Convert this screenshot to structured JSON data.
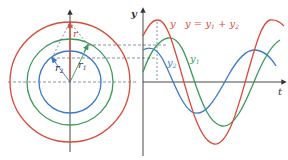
{
  "diagram": {
    "phasor": {
      "labels": {
        "r": "r",
        "r1": "r",
        "r1_sub": "1",
        "r2": "r",
        "r2_sub": "2"
      },
      "circles": [
        {
          "name": "resultant",
          "color": "#d94a38"
        },
        {
          "name": "y1",
          "color": "#3a9a5a"
        },
        {
          "name": "y2",
          "color": "#3a7ac8"
        }
      ]
    },
    "graph": {
      "y_axis_label": "y",
      "t_axis_label": "t",
      "curve_labels": {
        "y": "y",
        "equation": "y = y",
        "eq_sub1": "1",
        "eq_plus": " + y",
        "eq_sub2": "2",
        "y1": "y",
        "y1_sub": "1",
        "y2": "y",
        "y2_sub": "2"
      }
    },
    "colors": {
      "red": "#d94a38",
      "green": "#3a9a5a",
      "blue": "#3a7ac8",
      "axis": "#333333",
      "dashed": "#556677"
    }
  }
}
